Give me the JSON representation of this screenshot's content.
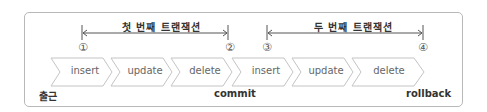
{
  "transactions": [
    {
      "title": "첫 번째 트랜잭션",
      "start_marker": "①",
      "end_marker": "②"
    },
    {
      "title": "두 번째 트랜잭션",
      "start_marker": "③",
      "end_marker": "④"
    }
  ],
  "steps": [
    "insert",
    "update",
    "delete",
    "insert",
    "update",
    "delete"
  ],
  "labels": {
    "start": "출근",
    "commit": "commit",
    "rollback": "rollback"
  },
  "colors": {
    "border": "#b8b8b8",
    "chevron_fill": "#ffffff",
    "chevron_stroke": "#c4c4c4",
    "line": "#555555"
  }
}
